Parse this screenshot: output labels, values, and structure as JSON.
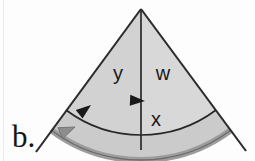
{
  "figure": {
    "panel_label": "b.",
    "background_color": "#fdfdfd",
    "labels": {
      "left_sector": "y",
      "right_sector": "w",
      "lower_band": "x"
    },
    "geometry": {
      "apex_x": 141,
      "apex_y": 9,
      "left_ray_end_x": 36,
      "left_ray_end_y": 152,
      "right_ray_end_x": 246,
      "right_ray_end_y": 151,
      "center_line_end_x": 141,
      "center_line_end_y": 150,
      "inner_arc_radius": 110,
      "outer_arc_radius": 140
    },
    "colors": {
      "sector_fill": "#d4d4d4",
      "band_fill": "#c9c9c9",
      "outline": "#2b2b2b",
      "outer_arc_stroke": "#9a9a9a",
      "arrow_black": "#1a1a1a",
      "arrow_gray": "#8f8f8f",
      "text": "#1a1a1a"
    },
    "elements": {
      "inner_arc_arrow_left": "arrowhead-left-icon",
      "inner_arc_arrow_center": "arrowhead-left-icon",
      "outer_arc_arrow": "arrowhead-gray-left-icon"
    }
  }
}
